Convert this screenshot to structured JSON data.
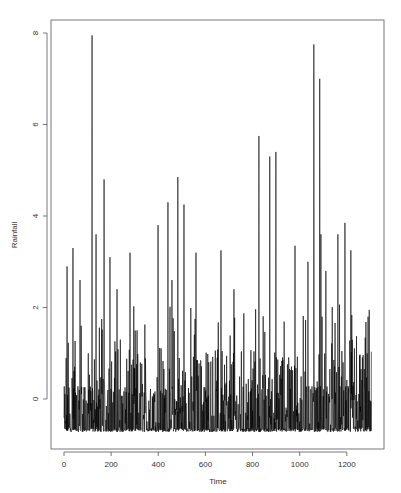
{
  "chart_data": {
    "type": "line",
    "title": "",
    "xlabel": "Time",
    "ylabel": "Rainfall",
    "xlim": [
      -55,
      1360
    ],
    "ylim": [
      -1.1,
      8.3
    ],
    "x_ticks": [
      0,
      200,
      400,
      600,
      800,
      1000,
      1200
    ],
    "y_ticks": [
      0,
      2,
      4,
      6,
      8
    ],
    "grid": false,
    "legend": null,
    "line_color": "#000000",
    "series_length": 1305,
    "baseline_min": -0.72,
    "series": [
      {
        "name": "Rainfall",
        "description": "Standardized rainfall time series, dense spiky signal with floor near -0.72",
        "peaks": [
          {
            "t": 13,
            "v": 2.9
          },
          {
            "t": 38,
            "v": 3.3
          },
          {
            "t": 68,
            "v": 2.6
          },
          {
            "t": 119,
            "v": 7.95
          },
          {
            "t": 136,
            "v": 3.6
          },
          {
            "t": 170,
            "v": 4.8
          },
          {
            "t": 195,
            "v": 3.1
          },
          {
            "t": 225,
            "v": 2.4
          },
          {
            "t": 280,
            "v": 3.2
          },
          {
            "t": 399,
            "v": 3.8
          },
          {
            "t": 441,
            "v": 4.3
          },
          {
            "t": 458,
            "v": 2.6
          },
          {
            "t": 483,
            "v": 4.85
          },
          {
            "t": 509,
            "v": 4.25
          },
          {
            "t": 560,
            "v": 3.2
          },
          {
            "t": 666,
            "v": 3.25
          },
          {
            "t": 721,
            "v": 2.4
          },
          {
            "t": 827,
            "v": 5.75
          },
          {
            "t": 873,
            "v": 5.3
          },
          {
            "t": 899,
            "v": 5.4
          },
          {
            "t": 980,
            "v": 3.35
          },
          {
            "t": 1035,
            "v": 3.0
          },
          {
            "t": 1060,
            "v": 7.75
          },
          {
            "t": 1085,
            "v": 7.0
          },
          {
            "t": 1090,
            "v": 3.6
          },
          {
            "t": 1111,
            "v": 2.8
          },
          {
            "t": 1162,
            "v": 3.6
          },
          {
            "t": 1192,
            "v": 3.85
          },
          {
            "t": 1217,
            "v": 3.25
          },
          {
            "t": 1290,
            "v": 1.8
          }
        ]
      }
    ]
  }
}
